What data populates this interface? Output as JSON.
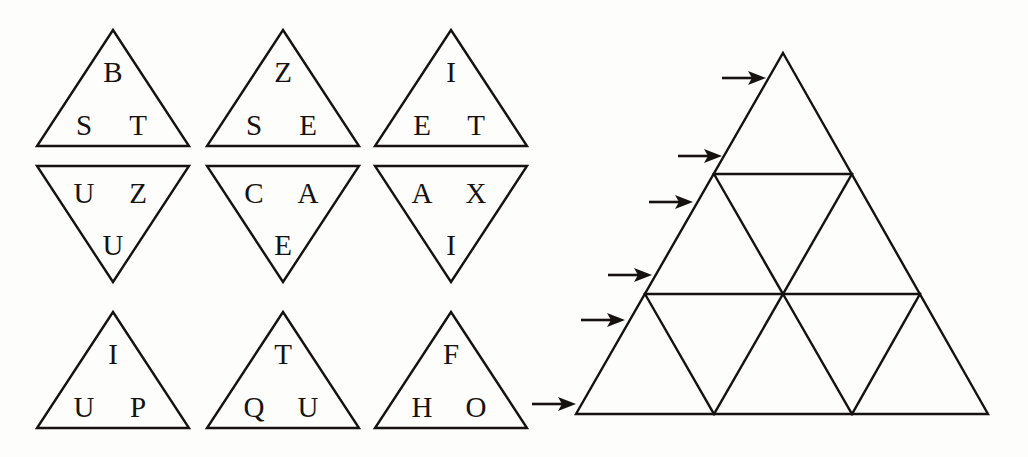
{
  "figure": {
    "name": "triangle-letter-puzzle",
    "background_color": "#fdfdfc",
    "ink_color": "#15120f"
  },
  "left_panel": {
    "name": "lettered-triangle-grid",
    "rows": 3,
    "columns": 3,
    "tiles": [
      {
        "id": "tile-r1c1",
        "orientation": "up",
        "letters": [
          "B",
          "S",
          "T"
        ],
        "apex": "B",
        "left": "S",
        "right": "T"
      },
      {
        "id": "tile-r1c2",
        "orientation": "up",
        "letters": [
          "Z",
          "S",
          "E"
        ],
        "apex": "Z",
        "left": "S",
        "right": "E"
      },
      {
        "id": "tile-r1c3",
        "orientation": "up",
        "letters": [
          "I",
          "E",
          "T"
        ],
        "apex": "I",
        "left": "E",
        "right": "T"
      },
      {
        "id": "tile-r2c1",
        "orientation": "down",
        "letters": [
          "U",
          "Z",
          "U"
        ],
        "apex": "U",
        "left": "U",
        "right": "Z"
      },
      {
        "id": "tile-r2c2",
        "orientation": "down",
        "letters": [
          "C",
          "A",
          "E"
        ],
        "apex": "E",
        "left": "C",
        "right": "A"
      },
      {
        "id": "tile-r2c3",
        "orientation": "down",
        "letters": [
          "A",
          "X",
          "I"
        ],
        "apex": "I",
        "left": "A",
        "right": "X"
      },
      {
        "id": "tile-r3c1",
        "orientation": "up",
        "letters": [
          "I",
          "U",
          "P"
        ],
        "apex": "I",
        "left": "U",
        "right": "P"
      },
      {
        "id": "tile-r3c2",
        "orientation": "up",
        "letters": [
          "T",
          "Q",
          "U"
        ],
        "apex": "T",
        "left": "Q",
        "right": "U"
      },
      {
        "id": "tile-r3c3",
        "orientation": "up",
        "letters": [
          "F",
          "H",
          "O"
        ],
        "apex": "F",
        "left": "H",
        "right": "O"
      }
    ]
  },
  "right_panel": {
    "name": "subdivided-triangle-diagram",
    "subdivision_rows": 3,
    "small_triangle_count": 9,
    "upward_triangle_count": 6,
    "downward_triangle_count": 3,
    "arrow_count": 6,
    "arrow_direction": "right",
    "arrows": [
      {
        "id": "arrow-1",
        "target_row": 1,
        "y": 78
      },
      {
        "id": "arrow-2",
        "target_row": 2,
        "y": 156
      },
      {
        "id": "arrow-3",
        "target_row": 2,
        "y": 202
      },
      {
        "id": "arrow-4",
        "target_row": 3,
        "y": 275
      },
      {
        "id": "arrow-5",
        "target_row": 3,
        "y": 320
      },
      {
        "id": "arrow-6",
        "target_row": 3,
        "y": 404
      }
    ]
  },
  "geometry": {
    "left_tiles": [
      {
        "cx": 113,
        "cy": 30,
        "w": 152,
        "h": 116,
        "dir": "up"
      },
      {
        "cx": 283,
        "cy": 30,
        "w": 152,
        "h": 116,
        "dir": "up"
      },
      {
        "cx": 451,
        "cy": 30,
        "w": 152,
        "h": 116,
        "dir": "up"
      },
      {
        "cx": 113,
        "cy": 166,
        "w": 152,
        "h": 116,
        "dir": "down"
      },
      {
        "cx": 283,
        "cy": 166,
        "w": 152,
        "h": 116,
        "dir": "down"
      },
      {
        "cx": 451,
        "cy": 166,
        "w": 152,
        "h": 116,
        "dir": "down"
      },
      {
        "cx": 113,
        "cy": 312,
        "w": 152,
        "h": 116,
        "dir": "up"
      },
      {
        "cx": 283,
        "cy": 312,
        "w": 152,
        "h": 116,
        "dir": "up"
      },
      {
        "cx": 451,
        "cy": 312,
        "w": 152,
        "h": 116,
        "dir": "up"
      }
    ],
    "big_triangle": {
      "apex_x": 783,
      "apex_y": 53,
      "left_x": 576,
      "right_x": 988,
      "base_y": 414
    }
  }
}
